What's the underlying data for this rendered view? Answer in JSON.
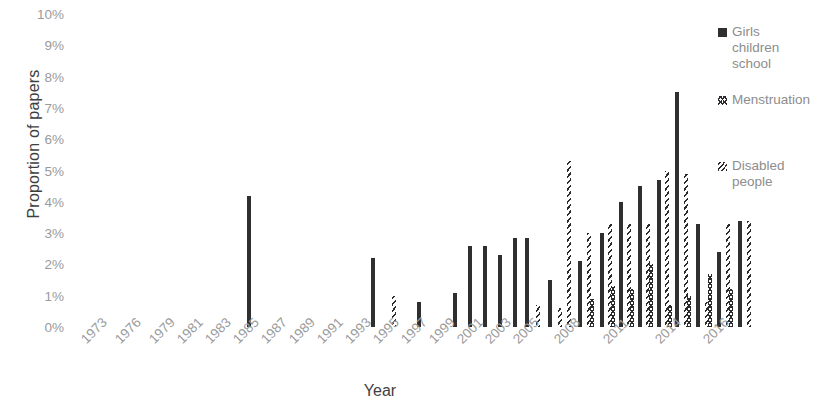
{
  "chart_data": {
    "type": "bar",
    "title": "",
    "xlabel": "Year",
    "ylabel": "Proportion of papers",
    "ylim": [
      0,
      10
    ],
    "ytick_labels": [
      "0%",
      "1%",
      "2%",
      "3%",
      "4%",
      "5%",
      "6%",
      "7%",
      "8%",
      "9%",
      "10%"
    ],
    "ytick_values": [
      0,
      1,
      2,
      3,
      4,
      5,
      6,
      7,
      8,
      9,
      10
    ],
    "grid": false,
    "legend_position": "right",
    "categories": [
      "1973",
      "1974",
      "1975",
      "1976",
      "1977",
      "1978",
      "1979",
      "1980",
      "1981",
      "1982",
      "1983",
      "1984",
      "1985",
      "1986",
      "1987",
      "1988",
      "1989",
      "1990",
      "1991",
      "1992",
      "1993",
      "1994",
      "1995",
      "1996",
      "1997",
      "1998",
      "1999",
      "2000",
      "2001",
      "2002",
      "2003",
      "2004",
      "2005",
      "2006",
      "2007",
      "2008",
      "2009",
      "2010",
      "2011",
      "2012",
      "2013",
      "2014",
      "2015",
      "2016",
      "2017"
    ],
    "xtick_labels": [
      "1973",
      "1976",
      "1979",
      "1981",
      "1983",
      "1985",
      "1987",
      "1989",
      "1991",
      "1993",
      "1995",
      "1997",
      "1999",
      "2001",
      "2003",
      "2005",
      "2008",
      "2011",
      "2014",
      "2016"
    ],
    "series": [
      {
        "name": "Girls children school",
        "pattern": "solid",
        "color": "#2f2f2f",
        "values": [
          0,
          0,
          0,
          0,
          0,
          0,
          0,
          0,
          0,
          0,
          0,
          0,
          0,
          4.2,
          0,
          0,
          0,
          0,
          0,
          0,
          2.2,
          0,
          0,
          0,
          0.8,
          0,
          1.1,
          2.6,
          2.6,
          2.3,
          2.85,
          2.85,
          1.5,
          2.1,
          3.0,
          4.0,
          4.0,
          4.5,
          4.7,
          7.5,
          3.3,
          2.4,
          3.4,
          0,
          0
        ]
      },
      {
        "name": "Menstruation",
        "pattern": "crosshatch",
        "color": "#2b2b2b",
        "values": [
          0,
          0,
          0,
          0,
          0,
          0,
          0,
          0,
          0,
          0,
          0,
          0,
          0,
          0,
          0,
          0,
          0,
          0,
          0,
          0,
          0,
          0,
          0,
          0,
          0,
          0,
          0,
          0,
          0,
          0,
          0,
          0,
          0,
          0,
          0,
          0.9,
          1.3,
          1.2,
          2.0,
          0.7,
          1.0,
          1.7,
          1.2,
          0,
          0
        ]
      },
      {
        "name": "Disabled people",
        "pattern": "diagonal",
        "color": "#2b2b2b",
        "values": [
          0,
          0,
          0,
          0,
          0,
          0,
          0,
          0,
          0,
          0,
          0,
          0,
          0,
          0,
          0,
          0,
          0,
          0,
          0,
          0,
          0,
          0,
          1.0,
          0,
          0,
          0,
          0,
          0,
          0,
          0,
          0.7,
          0.6,
          5.3,
          3.0,
          3.3,
          3.3,
          3.3,
          5.0,
          4.9,
          0.8,
          3.3,
          3.3,
          3.4,
          0,
          0
        ]
      }
    ],
    "bar_layout": [
      {
        "x": 247,
        "h": 4.2,
        "p": "solid"
      },
      {
        "x": 371,
        "h": 2.2,
        "p": "solid"
      },
      {
        "x": 392,
        "h": 1.0,
        "p": "diagonal"
      },
      {
        "x": 417,
        "h": 0.8,
        "p": "solid"
      },
      {
        "x": 453,
        "h": 1.1,
        "p": "solid"
      },
      {
        "x": 468,
        "h": 2.6,
        "p": "solid"
      },
      {
        "x": 483,
        "h": 2.6,
        "p": "solid"
      },
      {
        "x": 498,
        "h": 2.3,
        "p": "solid"
      },
      {
        "x": 513,
        "h": 2.85,
        "p": "solid"
      },
      {
        "x": 525,
        "h": 2.85,
        "p": "solid"
      },
      {
        "x": 536,
        "h": 0.7,
        "p": "diagonal"
      },
      {
        "x": 548,
        "h": 1.5,
        "p": "solid"
      },
      {
        "x": 558,
        "h": 0.6,
        "p": "diagonal"
      },
      {
        "x": 567,
        "h": 5.3,
        "p": "diagonal"
      },
      {
        "x": 578,
        "h": 2.1,
        "p": "solid"
      },
      {
        "x": 587,
        "h": 3.0,
        "p": "diagonal"
      },
      {
        "x": 590,
        "h": 0.9,
        "p": "crosshatch"
      },
      {
        "x": 600,
        "h": 3.0,
        "p": "solid"
      },
      {
        "x": 608,
        "h": 3.3,
        "p": "diagonal"
      },
      {
        "x": 611,
        "h": 1.3,
        "p": "crosshatch"
      },
      {
        "x": 619,
        "h": 4.0,
        "p": "solid"
      },
      {
        "x": 627,
        "h": 3.3,
        "p": "diagonal"
      },
      {
        "x": 630,
        "h": 1.2,
        "p": "crosshatch"
      },
      {
        "x": 638,
        "h": 4.5,
        "p": "solid"
      },
      {
        "x": 646,
        "h": 3.3,
        "p": "diagonal"
      },
      {
        "x": 649,
        "h": 2.0,
        "p": "crosshatch"
      },
      {
        "x": 657,
        "h": 4.7,
        "p": "solid"
      },
      {
        "x": 665,
        "h": 5.0,
        "p": "diagonal"
      },
      {
        "x": 668,
        "h": 0.7,
        "p": "crosshatch"
      },
      {
        "x": 675,
        "h": 7.5,
        "p": "solid"
      },
      {
        "x": 684,
        "h": 4.9,
        "p": "diagonal"
      },
      {
        "x": 687,
        "h": 1.0,
        "p": "crosshatch"
      },
      {
        "x": 696,
        "h": 3.3,
        "p": "solid"
      },
      {
        "x": 705,
        "h": 0.8,
        "p": "diagonal"
      },
      {
        "x": 708,
        "h": 1.7,
        "p": "crosshatch"
      },
      {
        "x": 717,
        "h": 2.4,
        "p": "solid"
      },
      {
        "x": 726,
        "h": 3.3,
        "p": "diagonal"
      },
      {
        "x": 729,
        "h": 1.2,
        "p": "crosshatch"
      },
      {
        "x": 738,
        "h": 3.4,
        "p": "solid"
      },
      {
        "x": 747,
        "h": 3.4,
        "p": "diagonal"
      }
    ]
  },
  "legend": {
    "items": [
      {
        "label": "Girls\nchildren\nschool",
        "pattern": "solid"
      },
      {
        "label": "Menstruation",
        "pattern": "crosshatch"
      },
      {
        "label": "Disabled\npeople",
        "pattern": "diagonal"
      }
    ]
  }
}
